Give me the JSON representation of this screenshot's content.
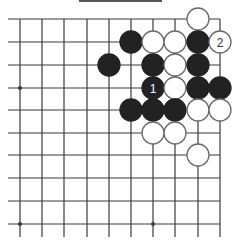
{
  "diagram": {
    "type": "go-board-fragment",
    "colors": {
      "background": "#ffffff",
      "line": "#3a3a3a",
      "black_stone": "#222222",
      "white_stone": "#ffffff",
      "white_stone_border": "#6a6a6a",
      "label_on_black": "#ffffff",
      "label_on_white": "#333333"
    },
    "grid": {
      "columns_x": [
        20,
        42,
        64,
        87,
        109,
        131,
        153,
        175,
        198,
        220
      ],
      "rows_y": [
        19,
        42,
        65,
        88,
        110,
        133,
        155,
        178,
        201,
        224
      ],
      "left_extend_to": 8,
      "bottom_extend_to": 237,
      "top_edge": true,
      "right_edge": true
    },
    "star_points": [
      [
        0,
        3
      ],
      [
        0,
        9
      ],
      [
        6,
        9
      ]
    ],
    "stone_radius": 11,
    "stones": [
      {
        "col": 8,
        "row": 0,
        "color": "white"
      },
      {
        "col": 5,
        "row": 1,
        "color": "black"
      },
      {
        "col": 6,
        "row": 1,
        "color": "white"
      },
      {
        "col": 7,
        "row": 1,
        "color": "white"
      },
      {
        "col": 8,
        "row": 1,
        "color": "black"
      },
      {
        "col": 9,
        "row": 1,
        "color": "white",
        "label": "2"
      },
      {
        "col": 4,
        "row": 2,
        "color": "black"
      },
      {
        "col": 6,
        "row": 2,
        "color": "black"
      },
      {
        "col": 7,
        "row": 2,
        "color": "white"
      },
      {
        "col": 8,
        "row": 2,
        "color": "black"
      },
      {
        "col": 6,
        "row": 3,
        "color": "black",
        "label": "1"
      },
      {
        "col": 7,
        "row": 3,
        "color": "white"
      },
      {
        "col": 8,
        "row": 3,
        "color": "black"
      },
      {
        "col": 9,
        "row": 3,
        "color": "black"
      },
      {
        "col": 5,
        "row": 4,
        "color": "black"
      },
      {
        "col": 6,
        "row": 4,
        "color": "black"
      },
      {
        "col": 7,
        "row": 4,
        "color": "black"
      },
      {
        "col": 8,
        "row": 4,
        "color": "white"
      },
      {
        "col": 9,
        "row": 4,
        "color": "white"
      },
      {
        "col": 6,
        "row": 5,
        "color": "white"
      },
      {
        "col": 7,
        "row": 5,
        "color": "white"
      },
      {
        "col": 8,
        "row": 6,
        "color": "white"
      }
    ]
  }
}
